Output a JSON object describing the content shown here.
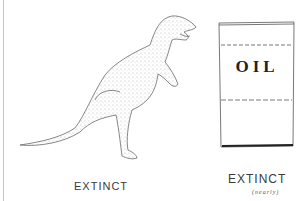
{
  "illustration": {
    "left_panel": {
      "subject": "tyrannosaurus",
      "caption": "EXTINCT"
    },
    "right_panel": {
      "subject": "oil barrel",
      "barrel_text": "OIL",
      "caption": "EXTINCT",
      "sub_caption": "(nearly)"
    }
  },
  "colors": {
    "ink": "#3a3a3a",
    "background": "#ffffff"
  }
}
